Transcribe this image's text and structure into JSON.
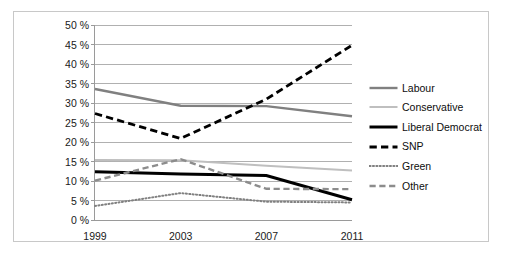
{
  "chart_data": {
    "type": "line",
    "title": "",
    "xlabel": "",
    "ylabel": "",
    "categories": [
      "1999",
      "2003",
      "2007",
      "2011"
    ],
    "x": [
      1999,
      2003,
      2007,
      2011
    ],
    "ylim": [
      0,
      50
    ],
    "ytick_values": [
      0,
      5,
      10,
      15,
      20,
      25,
      30,
      35,
      40,
      45,
      50
    ],
    "ytick_labels": [
      "0 %",
      "5 %",
      "10 %",
      "15 %",
      "20 %",
      "25 %",
      "30 %",
      "35 %",
      "40 %",
      "45 %",
      "50 %"
    ],
    "grid": true,
    "legend_position": "right",
    "series": [
      {
        "name": "Labour",
        "values": [
          33.6,
          29.3,
          29.2,
          26.6
        ],
        "color": "#808080",
        "style": "solid",
        "width": 2.4
      },
      {
        "name": "Conservative",
        "values": [
          15.4,
          15.3,
          13.9,
          12.7
        ],
        "color": "#bfbfbf",
        "style": "solid",
        "width": 2.0
      },
      {
        "name": "Liberal Democrat",
        "values": [
          12.4,
          11.8,
          11.4,
          5.2
        ],
        "color": "#000000",
        "style": "solid",
        "width": 3.0
      },
      {
        "name": "SNP",
        "values": [
          27.3,
          20.9,
          31.0,
          44.8
        ],
        "color": "#000000",
        "style": "dashed",
        "width": 2.8
      },
      {
        "name": "Green",
        "values": [
          3.6,
          6.9,
          4.7,
          4.5
        ],
        "color": "#808080",
        "style": "dotted",
        "width": 2.0
      },
      {
        "name": "Other",
        "values": [
          10.1,
          15.6,
          8.0,
          7.9
        ],
        "color": "#8c8c8c",
        "style": "dashed",
        "width": 2.4
      }
    ]
  },
  "legend": {
    "items": [
      {
        "label": "Labour"
      },
      {
        "label": "Conservative"
      },
      {
        "label": "Liberal Democrat"
      },
      {
        "label": "SNP"
      },
      {
        "label": "Green"
      },
      {
        "label": "Other"
      }
    ]
  },
  "colors": {
    "frame_border": "#c8c8c8",
    "gridline": "#b0b0b0",
    "axis": "#9a9a9a",
    "text": "#1a1a1a",
    "background": "#ffffff"
  }
}
